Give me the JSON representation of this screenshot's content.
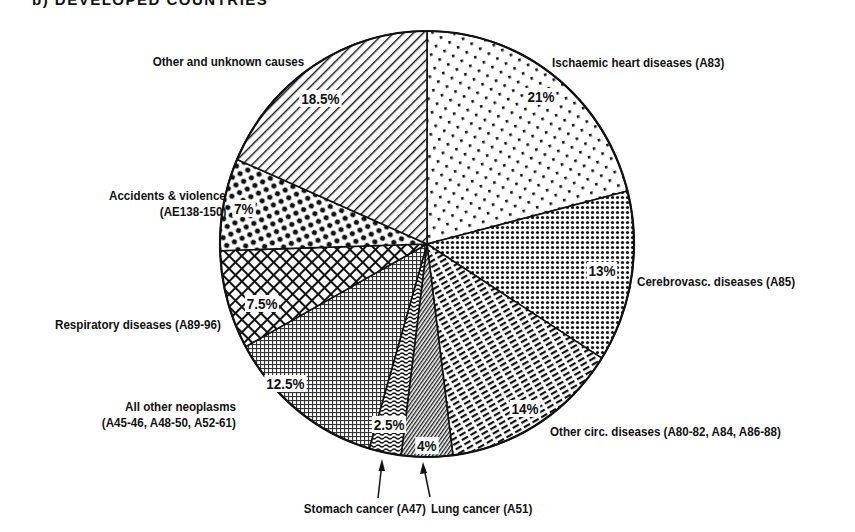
{
  "title": "b) DEVELOPED COUNTRIES",
  "chart_data": {
    "type": "pie",
    "title": "b) DEVELOPED COUNTRIES",
    "start_angle": "12 o'clock, clockwise",
    "slices": [
      {
        "label": "Ischaemic heart diseases (A83)",
        "value": 21,
        "pct_label": "21%",
        "pattern": "sparse-squares"
      },
      {
        "label": "Cerebrovasc. diseases (A85)",
        "value": 13,
        "pct_label": "13%",
        "pattern": "dense-dots"
      },
      {
        "label": "Other circ. diseases (A80-82, A84, A86-88)",
        "value": 14,
        "pct_label": "14%",
        "pattern": "dashed-diagonal"
      },
      {
        "label": "Lung cancer (A51)",
        "value": 4,
        "pct_label": "4%",
        "pattern": "fine-diagonal"
      },
      {
        "label": "Stomach cancer (A47)",
        "value": 2.5,
        "pct_label": "2.5%",
        "pattern": "wavy"
      },
      {
        "label": "All other neoplasms (A45-46, A48-50, A52-61)",
        "value": 12.5,
        "pct_label": "12.5%",
        "pattern": "fine-grid"
      },
      {
        "label": "Respiratory diseases (A89-96)",
        "value": 7.5,
        "pct_label": "7.5%",
        "pattern": "crosshatch"
      },
      {
        "label": "Accidents & violence (AE138-150)",
        "value": 7,
        "pct_label": "7%",
        "pattern": "large-dots"
      },
      {
        "label": "Other and unknown causes",
        "value": 18.5,
        "pct_label": "18.5%",
        "pattern": "diagonal-lines"
      }
    ]
  },
  "labels": {
    "ischaemic": "Ischaemic heart diseases (A83)",
    "cerebro": "Cerebrovasc. diseases (A85)",
    "othercirc": "Other circ. diseases (A80-82, A84, A86-88)",
    "lung": "Lung cancer (A51)",
    "stomach": "Stomach cancer (A47)",
    "neoplasms_1": "All other neoplasms",
    "neoplasms_2": "(A45-46, A48-50, A52-61)",
    "respiratory": "Respiratory diseases (A89-96)",
    "accidents_1": "Accidents & violence",
    "accidents_2": "(AE138-150)",
    "other": "Other and unknown causes"
  },
  "percents": {
    "ischaemic": "21%",
    "cerebro": "13%",
    "othercirc": "14%",
    "lung": "4%",
    "stomach": "2.5%",
    "neoplasms": "12.5%",
    "respiratory": "7.5%",
    "accidents": "7%",
    "other": "18.5%"
  }
}
